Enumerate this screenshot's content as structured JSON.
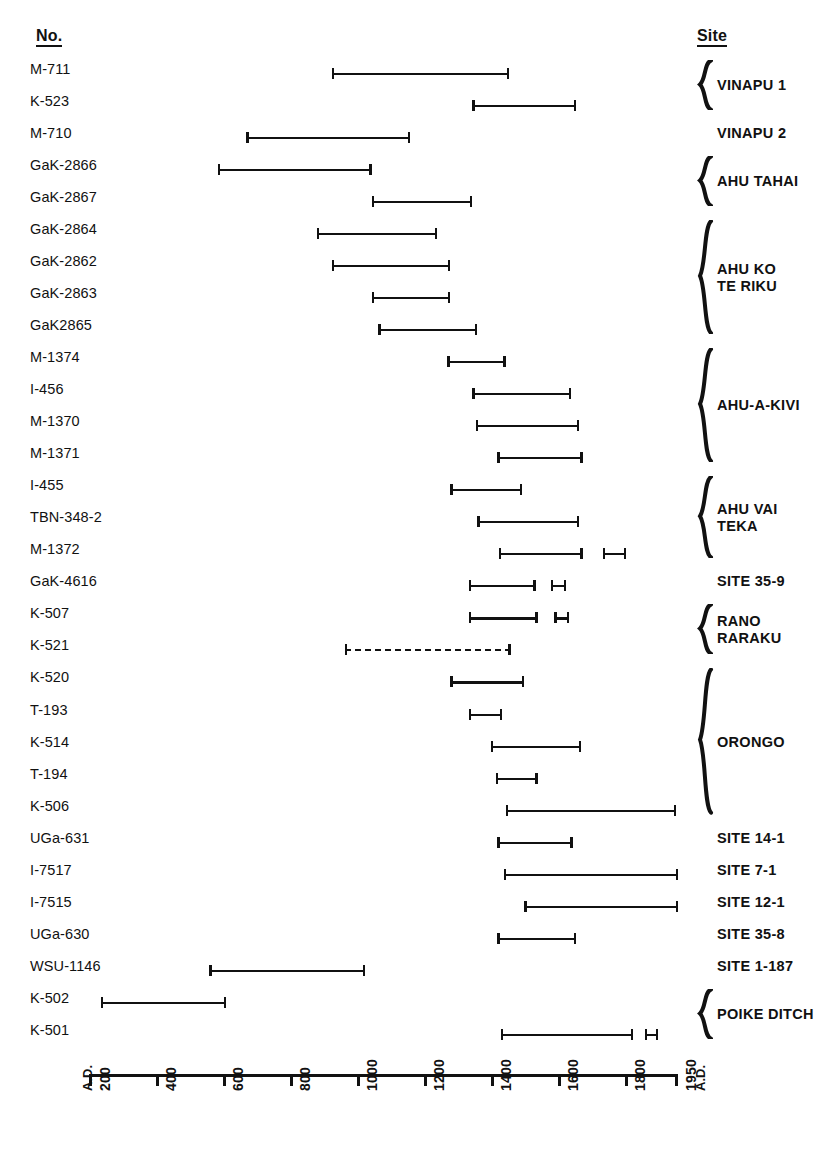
{
  "headers": {
    "number": "No.",
    "site": "Site"
  },
  "axis": {
    "label_left": "A.D.",
    "label_right": "A.D.",
    "ticks": [
      "200",
      "400",
      "600",
      "800",
      "1000",
      "1200",
      "1400",
      "1600",
      "1800",
      "1950"
    ],
    "tick_values": [
      200,
      400,
      600,
      800,
      1000,
      1200,
      1400,
      1600,
      1800,
      1950
    ],
    "min": 200,
    "max": 1950
  },
  "chart_data": {
    "type": "bar",
    "orientation": "horizontal",
    "title": "",
    "xlabel": "A.D.",
    "ylabel": "",
    "xlim": [
      200,
      1950
    ],
    "grid": false,
    "legend": "none",
    "note": "Horizontal range (error-bar) chart of radiocarbon date ranges for Easter Island samples",
    "categories": [
      "M-711",
      "K-523",
      "M-710",
      "GaK-2866",
      "GaK-2867",
      "GaK-2864",
      "GaK-2862",
      "GaK-2863",
      "GaK2865",
      "M-1374",
      "I-456",
      "M-1370",
      "M-1371",
      "I-455",
      "TBN-348-2",
      "M-1372",
      "GaK-4616",
      "K-507",
      "K-521",
      "K-520",
      "T-193",
      "K-514",
      "T-194",
      "K-506",
      "UGa-631",
      "I-7517",
      "I-7515",
      "UGa-630",
      "WSU-1146",
      "K-502",
      "K-501"
    ],
    "rows": [
      {
        "label": "M-711",
        "site_group": "VINAPU 1",
        "style": "solid",
        "ranges": [
          [
            920,
            1450
          ]
        ]
      },
      {
        "label": "K-523",
        "site_group": "VINAPU 1",
        "style": "solid",
        "ranges": [
          [
            1340,
            1650
          ]
        ]
      },
      {
        "label": "M-710",
        "site_group": "VINAPU 2",
        "style": "solid",
        "ranges": [
          [
            665,
            1155
          ]
        ]
      },
      {
        "label": "GaK-2866",
        "site_group": "AHU TAHAI",
        "style": "solid",
        "ranges": [
          [
            580,
            1040
          ]
        ]
      },
      {
        "label": "GaK-2867",
        "site_group": "AHU TAHAI",
        "style": "solid",
        "ranges": [
          [
            1040,
            1340
          ]
        ]
      },
      {
        "label": "GaK-2864",
        "site_group": "AHU KO TE RIKU",
        "style": "solid",
        "ranges": [
          [
            875,
            1235
          ]
        ]
      },
      {
        "label": "GaK-2862",
        "site_group": "AHU KO TE RIKU",
        "style": "solid",
        "ranges": [
          [
            920,
            1275
          ]
        ]
      },
      {
        "label": "GaK-2863",
        "site_group": "AHU KO TE RIKU",
        "style": "solid",
        "ranges": [
          [
            1040,
            1275
          ]
        ]
      },
      {
        "label": "GaK2865",
        "site_group": "AHU KO TE RIKU",
        "style": "solid",
        "ranges": [
          [
            1060,
            1355
          ]
        ]
      },
      {
        "label": "M-1374",
        "site_group": "AHU-A-KIVI",
        "style": "solid",
        "ranges": [
          [
            1265,
            1440
          ]
        ]
      },
      {
        "label": "I-456",
        "site_group": "AHU-A-KIVI",
        "style": "solid",
        "ranges": [
          [
            1340,
            1635
          ]
        ]
      },
      {
        "label": "M-1370",
        "site_group": "AHU-A-KIVI",
        "style": "solid",
        "ranges": [
          [
            1350,
            1660
          ]
        ]
      },
      {
        "label": "M-1371",
        "site_group": "AHU-A-KIVI",
        "style": "solid",
        "ranges": [
          [
            1415,
            1670
          ]
        ]
      },
      {
        "label": "I-455",
        "site_group": "AHU VAI TEKA",
        "style": "solid",
        "ranges": [
          [
            1275,
            1490
          ]
        ]
      },
      {
        "label": "TBN-348-2",
        "site_group": "AHU VAI TEKA",
        "style": "solid",
        "ranges": [
          [
            1355,
            1660
          ]
        ]
      },
      {
        "label": "M-1372",
        "site_group": "AHU VAI TEKA",
        "style": "solid",
        "ranges": [
          [
            1420,
            1670
          ],
          [
            1730,
            1800
          ]
        ]
      },
      {
        "label": "GaK-4616",
        "site_group": "SITE 35-9",
        "style": "solid",
        "ranges": [
          [
            1330,
            1530
          ],
          [
            1575,
            1620
          ]
        ]
      },
      {
        "label": "K-507",
        "site_group": "RANO RARAKU",
        "style": "solid",
        "ranges": [
          [
            1330,
            1535
          ],
          [
            1585,
            1630
          ]
        ]
      },
      {
        "label": "K-521",
        "site_group": "RANO RARAKU",
        "style": "dashed",
        "ranges": [
          [
            960,
            1455
          ]
        ]
      },
      {
        "label": "K-520",
        "site_group": "ORONGO",
        "style": "solid",
        "ranges": [
          [
            1275,
            1495
          ]
        ]
      },
      {
        "label": "T-193",
        "site_group": "ORONGO",
        "style": "solid",
        "ranges": [
          [
            1330,
            1430
          ]
        ]
      },
      {
        "label": "K-514",
        "site_group": "ORONGO",
        "style": "solid",
        "ranges": [
          [
            1395,
            1665
          ]
        ]
      },
      {
        "label": "T-194",
        "site_group": "ORONGO",
        "style": "solid",
        "ranges": [
          [
            1410,
            1535
          ]
        ]
      },
      {
        "label": "K-506",
        "site_group": "ORONGO",
        "style": "solid",
        "ranges": [
          [
            1440,
            1950
          ]
        ]
      },
      {
        "label": "UGa-631",
        "site_group": "SITE 14-1",
        "style": "solid",
        "ranges": [
          [
            1415,
            1640
          ]
        ]
      },
      {
        "label": "I-7517",
        "site_group": "SITE 7-1",
        "style": "solid",
        "ranges": [
          [
            1435,
            1955
          ]
        ]
      },
      {
        "label": "I-7515",
        "site_group": "SITE 12-1",
        "style": "solid",
        "ranges": [
          [
            1495,
            1955
          ]
        ]
      },
      {
        "label": "UGa-630",
        "site_group": "SITE 35-8",
        "style": "solid",
        "ranges": [
          [
            1415,
            1650
          ]
        ]
      },
      {
        "label": "WSU-1146",
        "site_group": "SITE 1-187",
        "style": "solid",
        "ranges": [
          [
            555,
            1020
          ]
        ]
      },
      {
        "label": "K-502",
        "site_group": "POIKE DITCH",
        "style": "solid",
        "ranges": [
          [
            230,
            605
          ]
        ]
      },
      {
        "label": "K-501",
        "site_group": "POIKE DITCH",
        "style": "solid",
        "ranges": [
          [
            1425,
            1820
          ],
          [
            1855,
            1895
          ]
        ]
      }
    ]
  },
  "site_labels": [
    {
      "text": "VINAPU 1",
      "braced": true,
      "rows": [
        0,
        1
      ]
    },
    {
      "text": "VINAPU 2",
      "braced": false,
      "rows": [
        2,
        2
      ]
    },
    {
      "text": "AHU TAHAI",
      "braced": true,
      "rows": [
        3,
        4
      ]
    },
    {
      "text": "AHU KO\nTE RIKU",
      "braced": true,
      "rows": [
        5,
        8
      ]
    },
    {
      "text": "AHU-A-KIVI",
      "braced": true,
      "rows": [
        9,
        12
      ]
    },
    {
      "text": "AHU VAI\nTEKA",
      "braced": true,
      "rows": [
        13,
        15
      ]
    },
    {
      "text": "SITE 35-9",
      "braced": false,
      "rows": [
        16,
        16
      ]
    },
    {
      "text": "RANO\nRARAKU",
      "braced": true,
      "rows": [
        17,
        18
      ]
    },
    {
      "text": "ORONGO",
      "braced": true,
      "rows": [
        19,
        23
      ]
    },
    {
      "text": "SITE 14-1",
      "braced": false,
      "rows": [
        24,
        24
      ]
    },
    {
      "text": "SITE 7-1",
      "braced": false,
      "rows": [
        25,
        25
      ]
    },
    {
      "text": "SITE 12-1",
      "braced": false,
      "rows": [
        26,
        26
      ]
    },
    {
      "text": "SITE 35-8",
      "braced": false,
      "rows": [
        27,
        27
      ]
    },
    {
      "text": "SITE 1-187",
      "braced": false,
      "rows": [
        28,
        28
      ]
    },
    {
      "text": "POIKE DITCH",
      "braced": true,
      "rows": [
        29,
        30
      ]
    }
  ],
  "colors": {
    "ink": "#111111",
    "background": "#ffffff"
  }
}
